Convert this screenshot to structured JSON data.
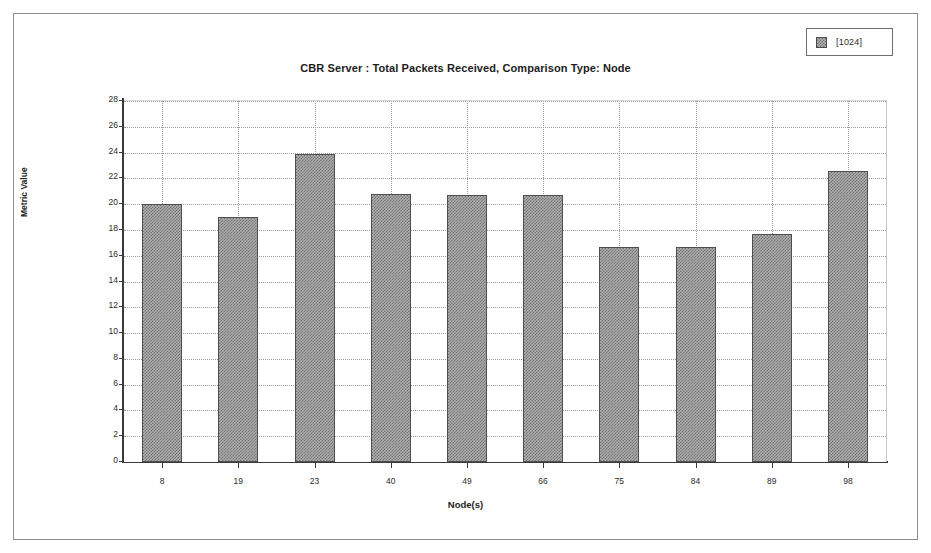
{
  "window": {
    "background_color": "#ffffff",
    "border_color": "#8d8d8d"
  },
  "legend": {
    "position": "top-right",
    "swatch_name": "series-swatch",
    "entries": [
      {
        "label": "[1024]",
        "color": "#b0b0b0"
      }
    ]
  },
  "chart_data": {
    "type": "bar",
    "title": "CBR Server :  Total Packets Received, Comparison Type: Node",
    "xlabel": "Node(s)",
    "ylabel": "Metric Value",
    "categories": [
      "8",
      "19",
      "23",
      "40",
      "49",
      "66",
      "75",
      "84",
      "89",
      "98"
    ],
    "series": [
      {
        "name": "[1024]",
        "values": [
          20.0,
          19.0,
          23.9,
          20.8,
          20.7,
          20.7,
          16.7,
          16.7,
          17.7,
          22.6
        ]
      }
    ],
    "ylim": [
      0,
      28
    ],
    "ytick_labels": [
      "0",
      "2",
      "4",
      "6",
      "8",
      "10",
      "12",
      "14",
      "16",
      "18",
      "20",
      "22",
      "24",
      "26",
      "28"
    ],
    "ytick_values": [
      0,
      2,
      4,
      6,
      8,
      10,
      12,
      14,
      16,
      18,
      20,
      22,
      24,
      26,
      28
    ],
    "grid": true,
    "grid_style": "dotted",
    "grid_color": "#9a9a9a",
    "legend_position": "top-right",
    "bar_fill_color": "#b0b0b0",
    "bar_border_color": "#4f4f4f",
    "axis_color": "#3a3a3a"
  }
}
